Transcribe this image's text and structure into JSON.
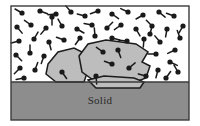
{
  "figure": {
    "type": "scientific-schematic",
    "labels": {
      "solid": "Solid"
    },
    "colors": {
      "liquid_background": "#ffffff",
      "solid_fill": "#8d8d8d",
      "crystal_fill": "#bdbdbd",
      "outline": "#1c1c1c",
      "frame": "#3b3b3b",
      "molecule": "#1a1a1a"
    },
    "regions": [
      {
        "name": "liquid-region",
        "fill": "#ffffff",
        "x": 11,
        "y": 6,
        "width": 178,
        "height": 76
      },
      {
        "name": "solid-region",
        "fill": "#8d8d8d",
        "x": 11,
        "y": 82,
        "width": 178,
        "height": 38,
        "label": "Solid"
      }
    ],
    "frame": {
      "x": 11,
      "y": 6,
      "width": 178,
      "height": 114
    },
    "crystals": [
      {
        "name": "crystal-left",
        "points": "48,64 58,52 74,48 86,54 88,70 84,82 56,82 46,74"
      },
      {
        "name": "crystal-main",
        "points": "79,56 88,44 106,40 136,44 148,52 142,62 150,66 146,78 130,84 96,82 82,72"
      },
      {
        "name": "crystal-lower-right",
        "points": "88,80 104,76 134,78 144,82 140,88 96,88"
      }
    ],
    "molecules": [
      {
        "x": 22,
        "y": 13,
        "angle": 210
      },
      {
        "x": 40,
        "y": 11,
        "angle": 20
      },
      {
        "x": 56,
        "y": 14,
        "angle": 175
      },
      {
        "x": 71,
        "y": 12,
        "angle": 230
      },
      {
        "x": 85,
        "y": 16,
        "angle": 195
      },
      {
        "x": 98,
        "y": 11,
        "angle": 160
      },
      {
        "x": 112,
        "y": 14,
        "angle": 35
      },
      {
        "x": 128,
        "y": 12,
        "angle": 205
      },
      {
        "x": 143,
        "y": 15,
        "angle": 150
      },
      {
        "x": 159,
        "y": 12,
        "angle": 40
      },
      {
        "x": 174,
        "y": 16,
        "angle": 200
      },
      {
        "x": 183,
        "y": 26,
        "angle": 120
      },
      {
        "x": 17,
        "y": 27,
        "angle": 50
      },
      {
        "x": 31,
        "y": 25,
        "angle": 215
      },
      {
        "x": 46,
        "y": 28,
        "angle": 130
      },
      {
        "x": 62,
        "y": 26,
        "angle": 240
      },
      {
        "x": 77,
        "y": 29,
        "angle": 30
      },
      {
        "x": 92,
        "y": 25,
        "angle": 190
      },
      {
        "x": 107,
        "y": 28,
        "angle": 315
      },
      {
        "x": 121,
        "y": 25,
        "angle": 145
      },
      {
        "x": 136,
        "y": 29,
        "angle": 60
      },
      {
        "x": 152,
        "y": 26,
        "angle": 225
      },
      {
        "x": 167,
        "y": 29,
        "angle": 100
      },
      {
        "x": 180,
        "y": 38,
        "angle": 250
      },
      {
        "x": 19,
        "y": 41,
        "angle": 165
      },
      {
        "x": 34,
        "y": 39,
        "angle": 300
      },
      {
        "x": 49,
        "y": 42,
        "angle": 75
      },
      {
        "x": 64,
        "y": 40,
        "angle": 200
      },
      {
        "x": 80,
        "y": 38,
        "angle": 125
      },
      {
        "x": 95,
        "y": 36,
        "angle": 265
      },
      {
        "x": 112,
        "y": 38,
        "angle": 15
      },
      {
        "x": 127,
        "y": 41,
        "angle": 185
      },
      {
        "x": 144,
        "y": 39,
        "angle": 95
      },
      {
        "x": 160,
        "y": 42,
        "angle": 230
      },
      {
        "x": 175,
        "y": 50,
        "angle": 155
      },
      {
        "x": 16,
        "y": 55,
        "angle": 45
      },
      {
        "x": 30,
        "y": 53,
        "angle": 270
      },
      {
        "x": 44,
        "y": 56,
        "angle": 110
      },
      {
        "x": 103,
        "y": 52,
        "angle": 215
      },
      {
        "x": 118,
        "y": 50,
        "angle": 70
      },
      {
        "x": 156,
        "y": 54,
        "angle": 180
      },
      {
        "x": 170,
        "y": 62,
        "angle": 25
      },
      {
        "x": 20,
        "y": 68,
        "angle": 135
      },
      {
        "x": 35,
        "y": 70,
        "angle": 290
      },
      {
        "x": 62,
        "y": 72,
        "angle": 55
      },
      {
        "x": 112,
        "y": 64,
        "angle": 200
      },
      {
        "x": 129,
        "y": 68,
        "angle": 320
      },
      {
        "x": 158,
        "y": 70,
        "angle": 105
      },
      {
        "x": 178,
        "y": 72,
        "angle": 240
      },
      {
        "x": 24,
        "y": 78,
        "angle": 170
      },
      {
        "x": 96,
        "y": 76,
        "angle": 85
      },
      {
        "x": 146,
        "y": 76,
        "angle": 195
      },
      {
        "x": 166,
        "y": 78,
        "angle": 305
      },
      {
        "x": 52,
        "y": 17,
        "angle": 90
      },
      {
        "x": 150,
        "y": 34,
        "angle": 285
      }
    ]
  }
}
